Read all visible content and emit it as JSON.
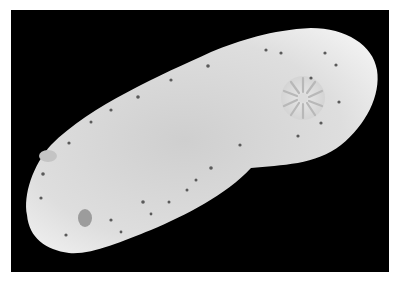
{
  "image": {
    "subject": "white dorid nudibranch (sea slug) on black background, dorsal view",
    "background_color": "#000000",
    "border_color": "#ffffff",
    "body_color": "#e4e4e4",
    "spot_color": "#5a5a5a",
    "features": [
      "elongated oval mantle",
      "branchial plume (gill rosette) near right end",
      "scattered dark spots along mantle margin"
    ]
  }
}
